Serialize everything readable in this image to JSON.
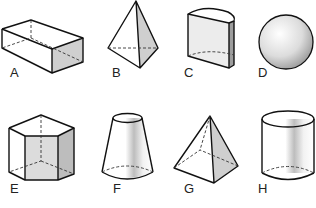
{
  "figure": {
    "shapes": [
      {
        "label": "A",
        "name": "rectangular prism"
      },
      {
        "label": "B",
        "name": "triangular pyramid"
      },
      {
        "label": "C",
        "name": "cylinder sector prism"
      },
      {
        "label": "D",
        "name": "sphere"
      },
      {
        "label": "E",
        "name": "pentagonal prism"
      },
      {
        "label": "F",
        "name": "truncated cone"
      },
      {
        "label": "G",
        "name": "square pyramid"
      },
      {
        "label": "H",
        "name": "cylinder"
      }
    ],
    "colors": {
      "edge": "#111111",
      "shade": "#cfcfcf",
      "face": "#ffffff"
    }
  }
}
